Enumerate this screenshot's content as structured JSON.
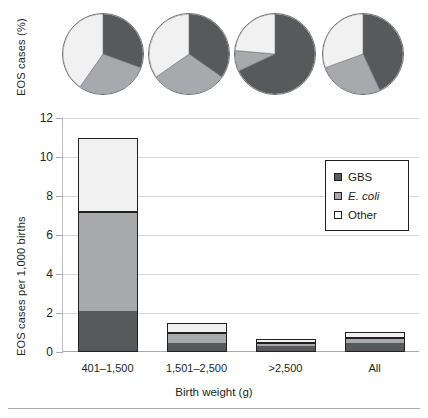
{
  "chart_data": [
    {
      "type": "pie",
      "title": "",
      "ylabel": "EOS cases (%)",
      "legend_position": "shared-with-bar-chart",
      "series_names": [
        "GBS",
        "E. coli",
        "Other"
      ],
      "panels": [
        {
          "category": "401–1,500",
          "labels": [
            "GBS",
            "E. coli",
            "Other"
          ],
          "values": [
            31,
            29,
            40
          ],
          "start_angles_deg": [
            0,
            110,
            215
          ]
        },
        {
          "category": "1,501–2,500",
          "labels": [
            "GBS",
            "E. coli",
            "Other"
          ],
          "values": [
            35,
            30,
            35
          ],
          "start_angles_deg": [
            0,
            125,
            235
          ]
        },
        {
          "category": ">2,500",
          "labels": [
            "GBS",
            "E. coli",
            "Other"
          ],
          "values": [
            68,
            8,
            24
          ],
          "start_angles_deg": [
            0,
            245,
            275
          ]
        },
        {
          "category": "All",
          "labels": [
            "GBS",
            "E. coli",
            "Other"
          ],
          "values": [
            43,
            26,
            31
          ],
          "start_angles_deg": [
            0,
            155,
            250
          ]
        }
      ]
    },
    {
      "type": "bar",
      "subtype": "stacked",
      "title": "",
      "xlabel": "Birth weight (g)",
      "ylabel": "EOS cases per 1,000 births",
      "categories": [
        "401–1,500",
        "1,501–2,500",
        ">2,500",
        "All"
      ],
      "ylim": [
        0,
        12
      ],
      "yticks": [
        0,
        2,
        4,
        6,
        8,
        10,
        12
      ],
      "ytick_labels": [
        "0",
        "2",
        "4",
        "6",
        "8",
        "10",
        "12"
      ],
      "grid": true,
      "series": [
        {
          "name": "GBS",
          "color": "#58595b",
          "values": [
            2.1,
            0.45,
            0.4,
            0.5
          ]
        },
        {
          "name": "E. coli",
          "color": "#a7a9ac",
          "values": [
            5.1,
            0.55,
            0.15,
            0.25
          ]
        },
        {
          "name": "Other",
          "color": "#f1f1f2",
          "values": [
            3.8,
            0.5,
            0.1,
            0.3
          ]
        }
      ],
      "totals": [
        11.0,
        1.5,
        0.65,
        1.05
      ]
    }
  ],
  "pie_axis": {
    "title": "EOS cases (%)"
  },
  "bar_axis": {
    "ylabel": "EOS cases per 1,000 births",
    "xlabel": "Birth weight (g)"
  },
  "legend": {
    "items": [
      {
        "label": "GBS",
        "swatch": "gbs",
        "italic": false
      },
      {
        "label": "E. coli",
        "swatch": "ecoli",
        "italic": true
      },
      {
        "label": "Other",
        "swatch": "other",
        "italic": false
      }
    ]
  },
  "colors": {
    "gbs": "#58595b",
    "ecoli": "#a7a9ac",
    "other": "#f1f1f2",
    "outline": "#231f20",
    "grid": "#d6d7d9"
  }
}
